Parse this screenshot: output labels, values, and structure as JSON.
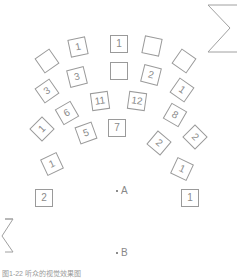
{
  "diagram": {
    "type": "seating-layout",
    "seats": [
      {
        "label": "1",
        "x": 69,
        "y": 38,
        "rot": -12
      },
      {
        "label": "1",
        "x": 110,
        "y": 35,
        "rot": 0
      },
      {
        "label": "",
        "x": 143,
        "y": 37,
        "rot": 12
      },
      {
        "label": "",
        "x": 38,
        "y": 52,
        "rot": -35
      },
      {
        "label": "",
        "x": 175,
        "y": 52,
        "rot": 35
      },
      {
        "label": "3",
        "x": 68,
        "y": 68,
        "rot": -14
      },
      {
        "label": "",
        "x": 110,
        "y": 62,
        "rot": 0
      },
      {
        "label": "2",
        "x": 142,
        "y": 66,
        "rot": 14
      },
      {
        "label": "3",
        "x": 38,
        "y": 82,
        "rot": -35
      },
      {
        "label": "1",
        "x": 173,
        "y": 81,
        "rot": 35
      },
      {
        "label": "11",
        "x": 91,
        "y": 92,
        "rot": -8
      },
      {
        "label": "12",
        "x": 128,
        "y": 92,
        "rot": 8
      },
      {
        "label": "6",
        "x": 58,
        "y": 104,
        "rot": -30
      },
      {
        "label": "8",
        "x": 166,
        "y": 106,
        "rot": 30
      },
      {
        "label": "7",
        "x": 108,
        "y": 119,
        "rot": 0
      },
      {
        "label": "5",
        "x": 77,
        "y": 124,
        "rot": -20
      },
      {
        "label": "1",
        "x": 33,
        "y": 120,
        "rot": -45
      },
      {
        "label": "2",
        "x": 150,
        "y": 134,
        "rot": 40
      },
      {
        "label": "2",
        "x": 186,
        "y": 128,
        "rot": 45
      },
      {
        "label": "1",
        "x": 43,
        "y": 155,
        "rot": -25
      },
      {
        "label": "1",
        "x": 173,
        "y": 160,
        "rot": 25
      },
      {
        "label": "2",
        "x": 35,
        "y": 189,
        "rot": 0
      },
      {
        "label": "1",
        "x": 181,
        "y": 189,
        "rot": 0
      }
    ],
    "points": [
      {
        "label": "A",
        "x": 116,
        "y": 191
      },
      {
        "label": "B",
        "x": 116,
        "y": 253
      }
    ],
    "caption": "图1-22   听众的视觉效果图",
    "colors": {
      "stroke": "#9a9a9a",
      "text": "#8a8a8a",
      "background": "#ffffff"
    }
  }
}
